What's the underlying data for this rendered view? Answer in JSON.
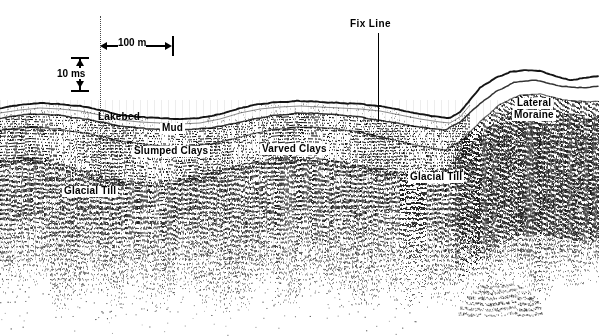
{
  "figure": {
    "type": "seismic-reflection-profile",
    "width": 599,
    "height": 336,
    "background_color": "#ffffff",
    "ink_color": "#000000"
  },
  "fix_line": {
    "label": "Fix Line",
    "x": 378,
    "label_y": 18,
    "stem_top": 33,
    "stem_bottom": 120
  },
  "survey_dotted_line": {
    "x": 100,
    "top": 16,
    "bottom": 200
  },
  "scale_bars": {
    "horizontal": {
      "label": "100 m",
      "x_start": 100,
      "x_end": 172,
      "y": 45
    },
    "vertical": {
      "label": "10 ms",
      "y_start": 57,
      "y_end": 90,
      "x": 79
    }
  },
  "unit_labels": [
    {
      "id": "lakebed",
      "text": "Lakebed",
      "x": 96,
      "y": 112,
      "font_size": 10,
      "boxed": false
    },
    {
      "id": "mud",
      "text": "Mud",
      "x": 160,
      "y": 123,
      "font_size": 10,
      "boxed": true
    },
    {
      "id": "slumped-clays",
      "text": "Slumped Clays",
      "x": 132,
      "y": 146,
      "font_size": 10,
      "boxed": true
    },
    {
      "id": "varved-clays",
      "text": "Varved Clays",
      "x": 260,
      "y": 144,
      "font_size": 10,
      "boxed": true
    },
    {
      "id": "glacial-till-left",
      "text": "Glacial Till",
      "x": 62,
      "y": 186,
      "font_size": 10,
      "boxed": true
    },
    {
      "id": "glacial-till-right",
      "text": "Glacial Till",
      "x": 408,
      "y": 172,
      "font_size": 10,
      "boxed": true
    },
    {
      "id": "lateral-moraine-line1",
      "text": "Lateral",
      "x": 515,
      "y": 98,
      "font_size": 10,
      "boxed": true
    },
    {
      "id": "lateral-moraine-line2",
      "text": "Moraine",
      "x": 512,
      "y": 110,
      "font_size": 10,
      "boxed": true
    }
  ],
  "chart_data": {
    "type": "line",
    "xlabel": "Distance along track",
    "ylabel": "Two-way travel time",
    "axis_note_horizontal": "100 m",
    "axis_note_vertical": "10 ms",
    "grid": false,
    "legend_position": "in-figure annotations",
    "horizons": [
      {
        "name": "Lakebed",
        "description": "Uppermost strong reflector / water-bottom multiple top",
        "points": [
          [
            0,
            108
          ],
          [
            20,
            105
          ],
          [
            40,
            103
          ],
          [
            60,
            104
          ],
          [
            80,
            106
          ],
          [
            100,
            110
          ],
          [
            120,
            115
          ],
          [
            140,
            117
          ],
          [
            160,
            118
          ],
          [
            180,
            119
          ],
          [
            200,
            118
          ],
          [
            220,
            114
          ],
          [
            240,
            108
          ],
          [
            260,
            104
          ],
          [
            280,
            102
          ],
          [
            300,
            101
          ],
          [
            320,
            102
          ],
          [
            340,
            103
          ],
          [
            360,
            104
          ],
          [
            380,
            106
          ],
          [
            400,
            110
          ],
          [
            420,
            114
          ],
          [
            440,
            117
          ],
          [
            450,
            118
          ],
          [
            460,
            112
          ],
          [
            470,
            100
          ],
          [
            480,
            88
          ],
          [
            495,
            78
          ],
          [
            510,
            72
          ],
          [
            525,
            70
          ],
          [
            540,
            71
          ],
          [
            555,
            76
          ],
          [
            570,
            80
          ],
          [
            585,
            78
          ],
          [
            599,
            76
          ]
        ]
      },
      {
        "name": "Mud base",
        "description": "Base of the acoustically transparent mud drape",
        "points": [
          [
            0,
            118
          ],
          [
            30,
            114
          ],
          [
            60,
            115
          ],
          [
            90,
            120
          ],
          [
            120,
            126
          ],
          [
            150,
            129
          ],
          [
            180,
            130
          ],
          [
            210,
            128
          ],
          [
            240,
            122
          ],
          [
            270,
            116
          ],
          [
            300,
            113
          ],
          [
            330,
            114
          ],
          [
            360,
            117
          ],
          [
            390,
            122
          ],
          [
            420,
            127
          ],
          [
            445,
            130
          ],
          [
            460,
            122
          ],
          [
            475,
            108
          ],
          [
            495,
            92
          ],
          [
            515,
            82
          ],
          [
            535,
            80
          ],
          [
            560,
            86
          ],
          [
            585,
            88
          ],
          [
            599,
            86
          ]
        ]
      },
      {
        "name": "Varved clays top",
        "description": "Top of well-stratified varved clay sequence",
        "points": [
          [
            0,
            130
          ],
          [
            30,
            127
          ],
          [
            60,
            129
          ],
          [
            90,
            134
          ],
          [
            120,
            141
          ],
          [
            150,
            145
          ],
          [
            180,
            147
          ],
          [
            210,
            144
          ],
          [
            240,
            137
          ],
          [
            270,
            130
          ],
          [
            300,
            127
          ],
          [
            330,
            128
          ],
          [
            360,
            132
          ],
          [
            390,
            139
          ],
          [
            420,
            146
          ],
          [
            445,
            150
          ],
          [
            462,
            140
          ],
          [
            480,
            122
          ],
          [
            500,
            104
          ],
          [
            520,
            95
          ],
          [
            540,
            94
          ],
          [
            565,
            100
          ],
          [
            590,
            102
          ],
          [
            599,
            101
          ]
        ]
      },
      {
        "name": "Glacial till top",
        "description": "Irregular top of acoustically chaotic glacial till",
        "points": [
          [
            0,
            160
          ],
          [
            25,
            156
          ],
          [
            50,
            160
          ],
          [
            75,
            168
          ],
          [
            100,
            176
          ],
          [
            125,
            180
          ],
          [
            150,
            182
          ],
          [
            175,
            180
          ],
          [
            200,
            175
          ],
          [
            225,
            168
          ],
          [
            250,
            162
          ],
          [
            275,
            158
          ],
          [
            300,
            157
          ],
          [
            325,
            159
          ],
          [
            350,
            163
          ],
          [
            375,
            168
          ],
          [
            400,
            172
          ],
          [
            425,
            172
          ],
          [
            445,
            168
          ],
          [
            460,
            155
          ],
          [
            478,
            136
          ],
          [
            498,
            118
          ],
          [
            518,
            108
          ],
          [
            540,
            107
          ],
          [
            565,
            113
          ],
          [
            590,
            116
          ],
          [
            599,
            115
          ]
        ]
      }
    ],
    "units": [
      {
        "name": "Lakebed",
        "character": "Sharp continuous high-amplitude reflector"
      },
      {
        "name": "Mud",
        "character": "Acoustically transparent to weakly layered drape"
      },
      {
        "name": "Slumped Clays",
        "character": "Disturbed, discontinuous reflectors on basin flank"
      },
      {
        "name": "Varved Clays",
        "character": "Parallel, continuous, well-layered reflectors"
      },
      {
        "name": "Glacial Till",
        "character": "Chaotic, incoherent, hummocky returns"
      },
      {
        "name": "Lateral Moraine",
        "character": "Steep mounded chaotic body on basin margin"
      }
    ],
    "features": [
      {
        "name": "Fix Line",
        "x": 378,
        "description": "Navigation fix marker"
      },
      {
        "name": "Seabed multiple",
        "x": 500,
        "y": 300,
        "description": "Faint mound-shaped multiple at base of record"
      }
    ]
  }
}
